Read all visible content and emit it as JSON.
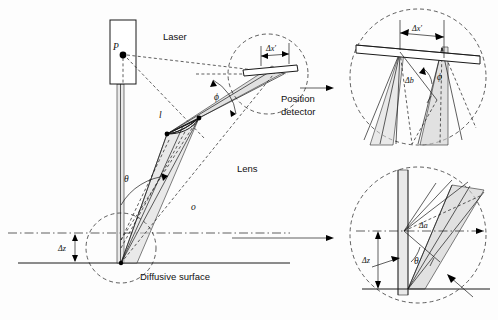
{
  "figure": {
    "type": "optical-ray-diagram"
  },
  "main": {
    "labels": {
      "laser": "Laser",
      "point_p": "P",
      "position_detector_line1": "Position",
      "position_detector_line2": "detector",
      "lens": "Lens",
      "diffusive_surface": "Diffusive surface",
      "delta_x_prime": "Δx′",
      "delta_z": "Δz",
      "theta": "θ",
      "phi": "ϕ",
      "distance_l": "l",
      "distance_o": "o"
    }
  },
  "detail_top": {
    "labels": {
      "delta_x_prime": "Δx′",
      "delta_b": "Δb",
      "phi": "ϕ"
    }
  },
  "detail_bottom": {
    "labels": {
      "delta_a": "Δa",
      "delta_z": "Δz",
      "theta": "θ"
    }
  },
  "colors": {
    "ink": "#1a1a1a",
    "beam_fill": "#d9d9d9",
    "background": "#fdfdfd"
  }
}
